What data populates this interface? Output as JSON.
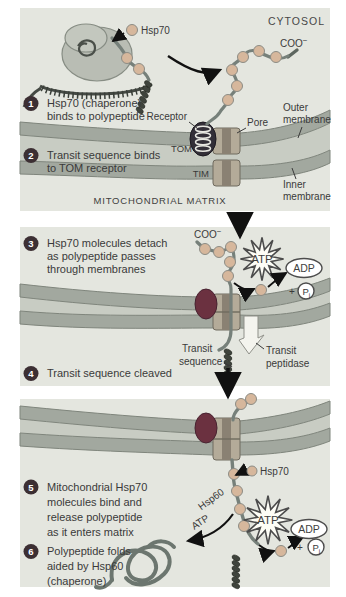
{
  "colors": {
    "page_bg": "#ffffff",
    "panel_bg": "#e4e6df",
    "intermembrane_space": "#c8ccc3",
    "membrane": "#a2a89f",
    "membrane_edge": "#7f857c",
    "pore_body": "#b4ab99",
    "pore_stripe": "#8a8173",
    "receptor_dark": "#332f38",
    "receptor_maroon": "#6b3140",
    "bead_tan": "#d6b79c",
    "strand_gray": "#76807a",
    "helix_dark": "#3f443d",
    "badge_dark": "#3c2f33",
    "burst_fill": "#fdfdf6",
    "arrow_black": "#111111"
  },
  "panel1": {
    "hsp70": "Hsp70",
    "cytosol": "CYTOSOL",
    "coo": "COO",
    "coo_sup": "−",
    "step1_num": "1",
    "step1_lines": [
      "Hsp70 (chaperone)",
      "binds to polypeptide"
    ],
    "step2_num": "2",
    "step2_lines": [
      "Transit sequence binds",
      "to TOM receptor"
    ],
    "receptor": "Receptor",
    "pore": "Pore",
    "tom": "TOM",
    "tim": "TIM",
    "outer_membrane_lines": [
      "Outer",
      "membrane"
    ],
    "inner_membrane_lines": [
      "Inner",
      "membrane"
    ],
    "matrix": "MITOCHONDRIAL MATRIX"
  },
  "panel2": {
    "step3_num": "3",
    "step3_lines": [
      "Hsp70 molecules detach",
      "as polypeptide passes",
      "through membranes"
    ],
    "step4_num": "4",
    "step4_line": "Transit sequence cleaved",
    "coo": "COO",
    "coo_sup": "−",
    "atp": "ATP",
    "adp": "ADP",
    "plus": "+",
    "p": "P",
    "p_sub": "i",
    "transit_sequence_lines": [
      "Transit",
      "sequence"
    ],
    "transit_peptidase_lines": [
      "Transit",
      "peptidase"
    ]
  },
  "panel3": {
    "step5_num": "5",
    "step5_lines": [
      "Mitochondrial Hsp70",
      "molecules bind and",
      "release polypeptide",
      "as it enters matrix"
    ],
    "step6_num": "6",
    "step6_lines": [
      "Polypeptide folds",
      "aided by Hsp60",
      "(chaperone)"
    ],
    "hsp70": "Hsp70",
    "hsp60": "Hsp60",
    "atp_flow": "ATP",
    "atp": "ATP",
    "adp": "ADP",
    "plus": "+",
    "p": "P",
    "p_sub": "i"
  }
}
